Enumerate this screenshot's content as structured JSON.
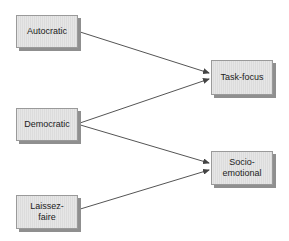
{
  "diagram": {
    "nodes": [
      {
        "id": "autocratic",
        "label": "Autocratic"
      },
      {
        "id": "democratic",
        "label": "Democratic"
      },
      {
        "id": "laissez_faire",
        "label": "Laissez-\nfaire"
      },
      {
        "id": "task_focus",
        "label": "Task-focus"
      },
      {
        "id": "socio_emotional",
        "label": "Socio-\nemotional"
      }
    ],
    "edges": [
      {
        "from": "autocratic",
        "to": "task_focus"
      },
      {
        "from": "democratic",
        "to": "task_focus"
      },
      {
        "from": "democratic",
        "to": "socio_emotional"
      },
      {
        "from": "laissez_faire",
        "to": "socio_emotional"
      }
    ],
    "colors": {
      "box_fill": "#e4e4e4",
      "box_border": "#9a9a9a",
      "shadow": "#8f8f8f",
      "line": "#555555"
    }
  }
}
